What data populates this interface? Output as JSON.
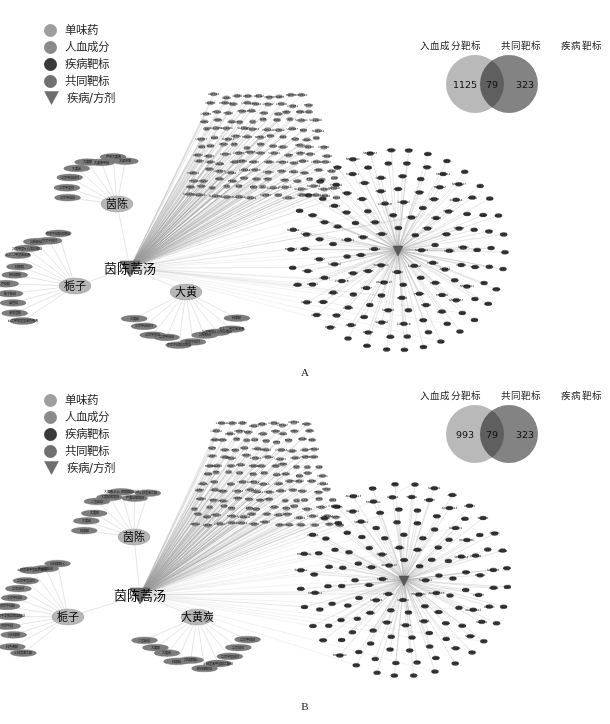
{
  "figure": {
    "panels": [
      {
        "id": "A",
        "letter": "A",
        "legend": {
          "items": [
            {
              "label": "单味药",
              "marker": "circle",
              "color": "#9e9e9e",
              "icon": "circle-icon"
            },
            {
              "label": "人血成分",
              "marker": "circle",
              "color": "#8a8a8a",
              "icon": "circle-icon"
            },
            {
              "label": "疾病靶标",
              "marker": "circle",
              "color": "#3a3a3a",
              "icon": "circle-icon"
            },
            {
              "label": "共同靶标",
              "marker": "circle",
              "color": "#707070",
              "icon": "circle-icon"
            },
            {
              "label": "疾病/方剂",
              "marker": "chevron",
              "color": "#6e6e6e",
              "icon": "chevron-down-icon"
            }
          ]
        },
        "venn": {
          "headers": [
            "入血成分靶标",
            "共同靶标",
            "疾病靶标"
          ],
          "left_value": "1125",
          "overlap_value": "79",
          "right_value": "323",
          "left_color": "#b9b9b9",
          "right_color": "#838383"
        },
        "network": {
          "formula": "茵陈蒿汤",
          "herbs": [
            "茵陈",
            "大黄",
            "栀子"
          ],
          "herb_compounds": [
            "6-乙甲氧基基苯色素素",
            "苯氧基酸",
            "蒿香苷",
            "栀子酸苷",
            "芥苷酸",
            "新绿原酸",
            "绿原酸",
            "3,7-二甲基苯皮素",
            "异氢甲基0-心氧化葡苷",
            "异栀酸苷",
            "京尼平苷甘",
            "京尼平苷酸双葡苷",
            "立尼甲苷苷",
            "立尼甲基苷",
            "立尼甲苷苷甘",
            "大黄酚",
            "大黄酸",
            "大黄素甲醚",
            "芦荟大黄素",
            "木犀草素",
            "大黄素葡萄糖苷",
            "各种酸芦芦大黄素-8-甲基",
            "大黄酸-8-O-葡萄糖苷苷苷"
          ],
          "compound_targets_sample": [
            "UGT1A1",
            "CASP7",
            "CASP3",
            "ABCB1",
            "ABCG2",
            "MAPK1",
            "MAPK3",
            "MAPK8",
            "MAPK14",
            "STAT3",
            "CDKN1A",
            "CYP3A4",
            "CYP1A2",
            "CYP2C9",
            "CYP2E1",
            "PTGS1",
            "PTGS2",
            "PPARA",
            "PPARG",
            "NR1I2",
            "NR1I3",
            "MMP2",
            "MMP9",
            "NQO1",
            "TNF",
            "IL6",
            "IL1B",
            "ESR1",
            "AR",
            "SLC22A1",
            "SLC22A6",
            "SLCO1B1",
            "SLCO1B3",
            "UGT1A4",
            "UGT1A9",
            "UGT2B7",
            "NAT2",
            "SULT1A1",
            "GSTP1",
            "HMOX1",
            "NFE2L2",
            "TP53",
            "AKT1",
            "EGFR",
            "VEGFA",
            "ALB",
            "CAT",
            "SOD1",
            "GPX1",
            "ABCC2",
            "ABCC3",
            "CYP2D6",
            "CYP2B6",
            "ADH1B",
            "ALDH2"
          ],
          "disease_targets_sample": [
            "SLC02A1",
            "SLC02A2",
            "SLC6A4",
            "RNA5ATAC",
            "UGT1A4",
            "RNASE2",
            "HBA1",
            "HBB",
            "ADAMTS13",
            "MIR125",
            "PIK3CA",
            "PIK3CB",
            "AGGR2",
            "GALP",
            "MGV17",
            "MYCA2",
            "TF",
            "SAMHD1",
            "GBC",
            "HCP",
            "CCDC11B",
            "SLC28A2",
            "AGR2",
            "CDKN1",
            "ABCA1",
            "ATP1A1",
            "ATP1A2",
            "ATP1C",
            "SPINK1",
            "ATP1B1",
            "PIK3CA",
            "MTHFR",
            "SLC4A1",
            "DUSP1",
            "ALPL",
            "MRSEH2",
            "SLC44A1",
            "KRAS",
            "TFPI",
            "LTM4",
            "TREX1",
            "SERPINA1",
            "SERPINA7",
            "APOA1",
            "APOB",
            "APOE",
            "TTR",
            "CP",
            "HP",
            "FGA",
            "FGB",
            "FGG",
            "PLG",
            "F2",
            "AHSG",
            "ORM1",
            "A2M",
            "C3",
            "C4A",
            "CFH",
            "ITIH4",
            "LBP",
            "RBP4",
            "TTR",
            "GC",
            "AFM"
          ]
        }
      },
      {
        "id": "B",
        "letter": "B",
        "legend": {
          "items": [
            {
              "label": "单味药",
              "marker": "circle",
              "color": "#9e9e9e",
              "icon": "circle-icon"
            },
            {
              "label": "人血成分",
              "marker": "circle",
              "color": "#8a8a8a",
              "icon": "circle-icon"
            },
            {
              "label": "疾病靶标",
              "marker": "circle",
              "color": "#3a3a3a",
              "icon": "circle-icon"
            },
            {
              "label": "共同靶标",
              "marker": "circle",
              "color": "#707070",
              "icon": "circle-icon"
            },
            {
              "label": "疾病/方剂",
              "marker": "chevron",
              "color": "#6e6e6e",
              "icon": "chevron-down-icon"
            }
          ]
        },
        "venn": {
          "headers": [
            "入血成分靶标",
            "共同靶标",
            "疾病靶标"
          ],
          "left_value": "993",
          "overlap_value": "79",
          "right_value": "323",
          "left_color": "#b9b9b9",
          "right_color": "#838383"
        },
        "network": {
          "formula": "茵陈蒿汤",
          "herbs": [
            "茵陈",
            "大黄炭",
            "栀子"
          ],
          "herb_compounds": [
            "4-羟基苯乙酸",
            "红色素酸",
            "异绿原酸",
            "京尼平苷",
            "京尼平龙胆双葡萄糖苷",
            "京尼平苷酸",
            "立尼甲苷苷",
            "立尼苷甘",
            "立尼甲基苷甘",
            "4-羟基苯甲基酸乙酯苷",
            "新绿原酸苷",
            "异绿原酸A",
            "绿原酸",
            "大黄酚",
            "大黄酸",
            "二氢酚苷",
            "大黄酸葡萄苷",
            "大黄素-8-O-葡萄糖苷苷苷",
            "严黄苷葡萄苷"
          ],
          "compound_targets_sample": [
            "CDKN1A",
            "CASP3",
            "CASP7",
            "ABCG2",
            "ABCB1",
            "CYP3A4",
            "CYP1A2",
            "UGT1A1",
            "MAPK1",
            "MAPK3",
            "STAT3",
            "PTGS2",
            "PPARA",
            "NR1I2",
            "MMP2",
            "MMP9",
            "TNF",
            "IL6",
            "IL1B",
            "TP53",
            "AKT1",
            "EGFR",
            "VEGFA",
            "ESR1",
            "NQO1",
            "HMOX1",
            "NFE2L2"
          ],
          "disease_targets_sample": [
            "SLC02A1",
            "RNA5ATAC",
            "UGT1A4",
            "PIK3CA",
            "MIR125",
            "ADAMTS13",
            "HBA1",
            "HBB",
            "TF",
            "SAMHD1",
            "ABCA1",
            "ATP1A1",
            "SLC4A1",
            "SPINK1",
            "APOA1",
            "APOE",
            "TTR",
            "ALB",
            "CP",
            "HP",
            "FGA",
            "FGB",
            "PLG",
            "F2",
            "A2M",
            "C3",
            "CFH",
            "RBP4",
            "GC",
            "AFM",
            "SERPINA1",
            "ORM1",
            "ITIH4",
            "LBP",
            "AHSG"
          ]
        }
      }
    ]
  }
}
